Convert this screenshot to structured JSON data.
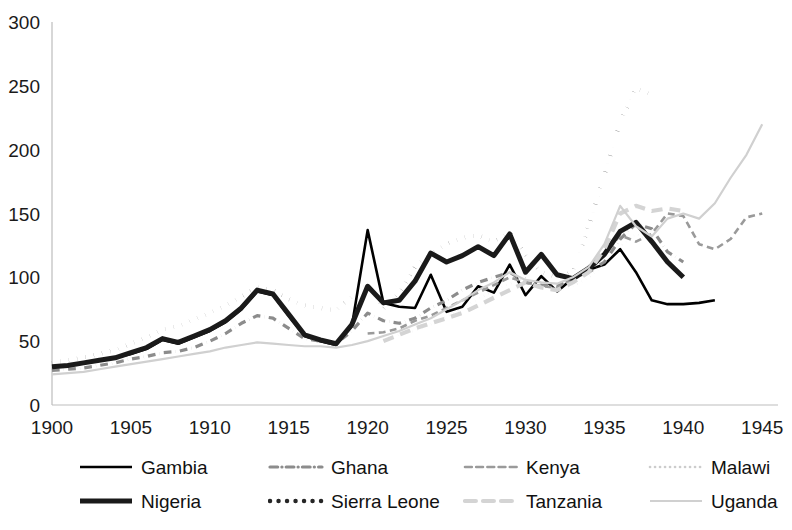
{
  "chart_data": {
    "type": "line",
    "title": "",
    "xlabel": "",
    "ylabel": "",
    "xlim": [
      1900,
      1946
    ],
    "ylim": [
      0,
      300
    ],
    "xticks": [
      1900,
      1905,
      1910,
      1915,
      1920,
      1925,
      1930,
      1935,
      1940,
      1945
    ],
    "yticks": [
      0,
      50,
      100,
      150,
      200,
      250,
      300
    ],
    "grid": false,
    "legend_position": "bottom",
    "series": [
      {
        "name": "Gambia",
        "style": "solid",
        "color": "#000000",
        "width": 2.6,
        "x": [
          1900,
          1901,
          1902,
          1903,
          1904,
          1905,
          1906,
          1907,
          1908,
          1909,
          1910,
          1911,
          1912,
          1913,
          1914,
          1915,
          1916,
          1917,
          1918,
          1919,
          1920,
          1921,
          1922,
          1923,
          1924,
          1925,
          1926,
          1927,
          1928,
          1929,
          1930,
          1931,
          1932,
          1933,
          1934,
          1935,
          1936,
          1937,
          1938,
          1939,
          1940,
          1941,
          1942
        ],
        "y": [
          30,
          31,
          33,
          35,
          37,
          40,
          44,
          51,
          48,
          53,
          58,
          65,
          75,
          89,
          86,
          70,
          54,
          50,
          47,
          62,
          137,
          80,
          77,
          76,
          102,
          73,
          77,
          93,
          88,
          110,
          86,
          101,
          89,
          99,
          106,
          110,
          122,
          104,
          82,
          79,
          79,
          80,
          82
        ]
      },
      {
        "name": "Ghana",
        "style": "dashdot",
        "color": "#8c8c8c",
        "width": 3.2,
        "x": [
          1900,
          1901,
          1902,
          1903,
          1904,
          1905,
          1906,
          1907,
          1908,
          1909,
          1910,
          1911,
          1912,
          1913,
          1914,
          1915,
          1916,
          1917,
          1918,
          1919,
          1920,
          1921,
          1922,
          1923,
          1924,
          1925,
          1926,
          1927,
          1928,
          1929,
          1930,
          1931,
          1932,
          1933,
          1934,
          1935,
          1936,
          1937,
          1938,
          1939,
          1940
        ],
        "y": [
          27,
          28,
          29,
          31,
          33,
          36,
          38,
          41,
          42,
          45,
          50,
          56,
          64,
          70,
          68,
          60,
          52,
          50,
          48,
          58,
          72,
          66,
          64,
          68,
          76,
          82,
          90,
          96,
          100,
          104,
          96,
          94,
          93,
          99,
          104,
          112,
          130,
          142,
          138,
          120,
          112
        ]
      },
      {
        "name": "Kenya",
        "style": "dashed",
        "color": "#9a9a9a",
        "width": 2.6,
        "x": [
          1920,
          1921,
          1922,
          1923,
          1924,
          1925,
          1926,
          1927,
          1928,
          1929,
          1930,
          1931,
          1932,
          1933,
          1934,
          1935,
          1936,
          1937,
          1938,
          1939,
          1940,
          1941,
          1942,
          1943,
          1944,
          1945
        ],
        "y": [
          56,
          57,
          60,
          66,
          70,
          76,
          82,
          88,
          94,
          100,
          96,
          93,
          92,
          99,
          104,
          118,
          133,
          128,
          134,
          150,
          148,
          126,
          122,
          130,
          147,
          150
        ]
      },
      {
        "name": "Malawi",
        "style": "dotted",
        "color": "#cccccc",
        "width": 2.6,
        "x": [
          1921,
          1922,
          1923,
          1924,
          1925,
          1926,
          1927,
          1928,
          1929,
          1930,
          1931,
          1932,
          1933,
          1934,
          1935,
          1936,
          1937,
          1938,
          1939,
          1940
        ],
        "y": [
          52,
          55,
          58,
          63,
          69,
          76,
          83,
          90,
          95,
          99,
          94,
          90,
          93,
          100,
          110,
          124,
          134,
          128,
          118,
          110
        ]
      },
      {
        "name": "Nigeria",
        "style": "solid",
        "color": "#1a1a1a",
        "width": 5.0,
        "x": [
          1900,
          1901,
          1902,
          1903,
          1904,
          1905,
          1906,
          1907,
          1908,
          1909,
          1910,
          1911,
          1912,
          1913,
          1914,
          1915,
          1916,
          1917,
          1918,
          1919,
          1920,
          1921,
          1922,
          1923,
          1924,
          1925,
          1926,
          1927,
          1928,
          1929,
          1930,
          1931,
          1932,
          1933,
          1934,
          1935,
          1936,
          1937,
          1938,
          1939,
          1940
        ],
        "y": [
          30,
          31,
          33,
          35,
          37,
          41,
          45,
          52,
          49,
          54,
          59,
          66,
          76,
          90,
          87,
          71,
          55,
          51,
          48,
          63,
          93,
          80,
          82,
          97,
          119,
          112,
          117,
          124,
          117,
          134,
          104,
          118,
          102,
          99,
          107,
          118,
          136,
          143,
          128,
          112,
          100
        ]
      },
      {
        "name": "Sierra Leone",
        "style": "dotted",
        "color": "#262626",
        "width": 4.4,
        "x": [
          1900,
          1901,
          1902,
          1903,
          1904,
          1905,
          1906,
          1907,
          1908,
          1909,
          1910,
          1911,
          1912,
          1913,
          1914,
          1915,
          1916,
          1917,
          1918,
          1919,
          1920,
          1921,
          1922,
          1923,
          1924,
          1925,
          1926,
          1927,
          1928,
          1929,
          1930,
          1931,
          1932,
          1933,
          1934,
          1935,
          1936,
          1937,
          1938
        ],
        "y": [
          33,
          35,
          37,
          40,
          43,
          48,
          53,
          59,
          62,
          67,
          72,
          78,
          85,
          92,
          90,
          83,
          78,
          76,
          74,
          85,
          94,
          75,
          88,
          108,
          118,
          126,
          131,
          133,
          128,
          135,
          118,
          104,
          100,
          104,
          140,
          180,
          222,
          248,
          243
        ]
      },
      {
        "name": "Tanzania",
        "style": "dashed",
        "color": "#d4d4d4",
        "width": 4.2,
        "x": [
          1921,
          1922,
          1923,
          1924,
          1925,
          1926,
          1927,
          1928,
          1929,
          1930,
          1931,
          1932,
          1933,
          1934,
          1935,
          1936,
          1937,
          1938,
          1939,
          1940
        ],
        "y": [
          50,
          55,
          60,
          64,
          68,
          72,
          78,
          84,
          90,
          96,
          92,
          90,
          96,
          104,
          122,
          150,
          156,
          152,
          154,
          152
        ]
      },
      {
        "name": "Uganda",
        "style": "solid",
        "color": "#d0d0d0",
        "width": 2.2,
        "x": [
          1900,
          1901,
          1902,
          1903,
          1904,
          1905,
          1906,
          1907,
          1908,
          1909,
          1910,
          1911,
          1912,
          1913,
          1914,
          1915,
          1916,
          1917,
          1918,
          1919,
          1920,
          1921,
          1922,
          1923,
          1924,
          1925,
          1926,
          1927,
          1928,
          1929,
          1930,
          1931,
          1932,
          1933,
          1934,
          1935,
          1936,
          1937,
          1938,
          1939,
          1940,
          1941,
          1942,
          1943,
          1944,
          1945
        ],
        "y": [
          24,
          25,
          26,
          28,
          30,
          32,
          34,
          36,
          38,
          40,
          42,
          45,
          47,
          49,
          48,
          47,
          46,
          46,
          45,
          47,
          50,
          54,
          58,
          63,
          68,
          75,
          82,
          90,
          96,
          104,
          98,
          96,
          95,
          100,
          108,
          126,
          156,
          140,
          132,
          146,
          150,
          146,
          158,
          178,
          196,
          220
        ]
      }
    ]
  },
  "legend": {
    "items": [
      {
        "label": "Gambia"
      },
      {
        "label": "Ghana"
      },
      {
        "label": "Kenya"
      },
      {
        "label": "Malawi"
      },
      {
        "label": "Nigeria"
      },
      {
        "label": "Sierra Leone"
      },
      {
        "label": "Tanzania"
      },
      {
        "label": "Uganda"
      }
    ]
  }
}
